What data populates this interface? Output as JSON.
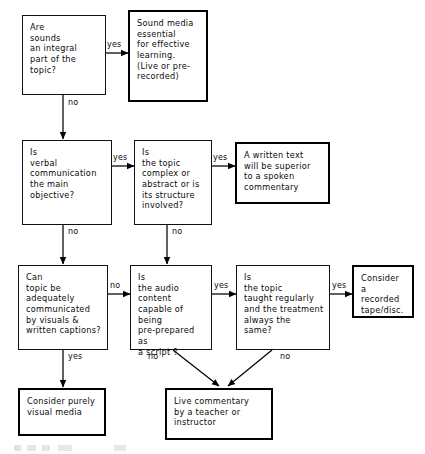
{
  "diagram": {
    "background_color": "#ffffff",
    "line_color": "#000000",
    "nodes": [
      {
        "id": "q_sounds",
        "kind": "decision",
        "border": "thin",
        "text": "Are\nsounds\nan integral\npart of the\ntopic?"
      },
      {
        "id": "r_sound_media",
        "kind": "outcome",
        "border": "thick",
        "text": "Sound media\nessential\nfor effective\nlearning.\n(Live or pre-\nrecorded)"
      },
      {
        "id": "q_verbal",
        "kind": "decision",
        "border": "thin",
        "text": "Is\nverbal\ncommunication\nthe main\nobjective?"
      },
      {
        "id": "q_complex",
        "kind": "decision",
        "border": "thin",
        "text": "Is\nthe topic\ncomplex or\nabstract or is\nits structure\ninvolved?"
      },
      {
        "id": "r_written_text",
        "kind": "outcome",
        "border": "thick",
        "text": "A written text\nwill be superior\nto a spoken\ncommentary"
      },
      {
        "id": "q_visuals",
        "kind": "decision",
        "border": "thin",
        "text": "Can\ntopic be\nadequately\ncommunicated\nby visuals &\nwritten captions?"
      },
      {
        "id": "q_audio_script",
        "kind": "decision",
        "border": "thin",
        "text": "Is\nthe audio\ncontent\ncapable of being\npre-prepared as\na script ?"
      },
      {
        "id": "q_regular",
        "kind": "decision",
        "border": "thin",
        "text": "Is\nthe topic\ntaught regularly\nand the treatment\nalways the\nsame?"
      },
      {
        "id": "r_recorded",
        "kind": "outcome",
        "border": "thick",
        "text": "Consider a\nrecorded\ntape/disc."
      },
      {
        "id": "r_visual_media",
        "kind": "outcome",
        "border": "thick",
        "text": "Consider purely\nvisual media"
      },
      {
        "id": "r_live_commentary",
        "kind": "outcome",
        "border": "thick",
        "text": "Live commentary\nby a teacher or\ninstructor"
      }
    ],
    "edge_labels": [
      {
        "id": "e1",
        "text": "yes",
        "from": "q_sounds",
        "to": "r_sound_media"
      },
      {
        "id": "e2",
        "text": "no",
        "from": "q_sounds",
        "to": "q_verbal"
      },
      {
        "id": "e3",
        "text": "yes",
        "from": "q_verbal",
        "to": "q_complex"
      },
      {
        "id": "e4",
        "text": "yes",
        "from": "q_complex",
        "to": "r_written_text"
      },
      {
        "id": "e5",
        "text": "no",
        "from": "q_verbal",
        "to": "q_visuals"
      },
      {
        "id": "e6",
        "text": "no",
        "from": "q_complex",
        "to": "q_audio_script"
      },
      {
        "id": "e7",
        "text": "no",
        "from": "q_visuals",
        "to": "q_audio_script"
      },
      {
        "id": "e8",
        "text": "yes",
        "from": "q_audio_script",
        "to": "q_regular"
      },
      {
        "id": "e9",
        "text": "yes",
        "from": "q_regular",
        "to": "r_recorded"
      },
      {
        "id": "e10",
        "text": "yes",
        "from": "q_visuals",
        "to": "r_visual_media"
      },
      {
        "id": "e11",
        "text": "no",
        "from": "q_audio_script",
        "to": "r_live_commentary"
      },
      {
        "id": "e12",
        "text": "no",
        "from": "q_regular",
        "to": "r_live_commentary"
      }
    ]
  }
}
